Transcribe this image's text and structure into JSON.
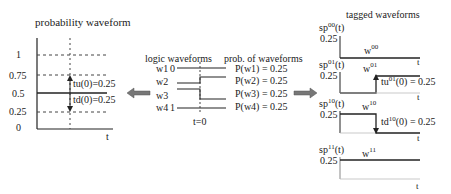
{
  "left_panel": {
    "title": "probability waveform",
    "y_ticks": [
      "1",
      "0.75",
      "0.5",
      "0.25",
      "0"
    ],
    "x_label": "t",
    "tu_label": "tu(0)=0.25",
    "td_label": "td(0)=0.25"
  },
  "middle_panel": {
    "logic_title": "logic waveforms",
    "prob_title": "prob. of waveforms",
    "waveforms": [
      {
        "name": "w1",
        "init": "0",
        "prob": "P(w1) = 0.25"
      },
      {
        "name": "w2",
        "init": "",
        "prob": "P(w2) = 0.25"
      },
      {
        "name": "w3",
        "init": "",
        "prob": "P(w3) = 0.25"
      },
      {
        "name": "w4",
        "init": "1",
        "prob": "P(w4) = 0.25"
      }
    ],
    "time_label": "t=0"
  },
  "right_panel": {
    "title": "tagged waveforms",
    "plots": [
      {
        "sp": "sp",
        "sup": "00",
        "arg": "(t)",
        "level": "0.25",
        "w": "w",
        "wsup": "00",
        "t": "t"
      },
      {
        "sp": "sp",
        "sup": "01",
        "arg": "(t)",
        "level": "0.25",
        "w": "w",
        "wsup": "01",
        "t": "t",
        "ann_pre": "tu",
        "ann_sup": "01",
        "ann_post": "(0) = 0.25"
      },
      {
        "sp": "sp",
        "sup": "10",
        "arg": "(t)",
        "level": "0.25",
        "w": "w",
        "wsup": "10",
        "t": "t",
        "ann_pre": "td",
        "ann_sup": "10",
        "ann_post": "(0) = 0.25"
      },
      {
        "sp": "sp",
        "sup": "11",
        "arg": "(t)",
        "level": "0.25",
        "w": "w",
        "wsup": "11",
        "t": "t"
      }
    ]
  },
  "colors": {
    "ink": "#222222",
    "arrow": "#666666",
    "dashed": "#444444"
  }
}
